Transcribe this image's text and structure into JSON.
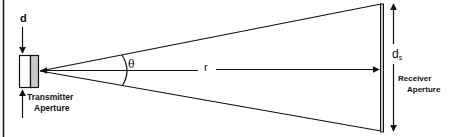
{
  "figure": {
    "type": "antenna geometry diagram",
    "colors": {
      "line": "#111111",
      "aperture_fill": "#c8c8c8",
      "background": "#ffffff"
    }
  },
  "labels": {
    "transmitter_size": "d",
    "beam_angle": "θ",
    "range": "r",
    "receiver_size_main": "d",
    "receiver_size_sub": "s",
    "transmitter_line1": "Transmitter",
    "transmitter_line2": "Aperture",
    "receiver_line1": "Receiver",
    "receiver_line2": "Aperture"
  }
}
